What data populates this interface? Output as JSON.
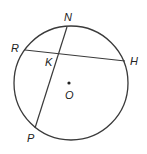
{
  "diagram": {
    "type": "circle-geometry",
    "circle": {
      "center_label": "O",
      "cx": 71,
      "cy": 83,
      "r": 57
    },
    "points": [
      {
        "id": "N",
        "label": "N",
        "x": 67,
        "y": 27,
        "label_x": 64,
        "label_y": 21
      },
      {
        "id": "R",
        "label": "R",
        "x": 25,
        "y": 50,
        "label_x": 11,
        "label_y": 52
      },
      {
        "id": "H",
        "label": "H",
        "x": 125,
        "y": 61,
        "label_x": 130,
        "label_y": 65
      },
      {
        "id": "P",
        "label": "P",
        "x": 35,
        "y": 128,
        "label_x": 27,
        "label_y": 142
      },
      {
        "id": "K",
        "label": "K",
        "x": 59,
        "y": 54,
        "label_x": 45,
        "label_y": 66
      },
      {
        "id": "O",
        "label": "O",
        "x": 69,
        "y": 83,
        "label_x": 65,
        "label_y": 99
      }
    ],
    "chords": [
      {
        "from": "R",
        "to": "H"
      },
      {
        "from": "N",
        "to": "P"
      }
    ],
    "colors": {
      "stroke": "#3a3a3a",
      "text": "#222222",
      "background": "#ffffff"
    }
  }
}
